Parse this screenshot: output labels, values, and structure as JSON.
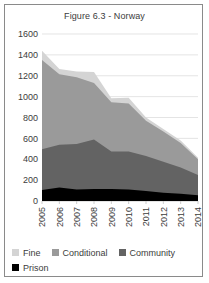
{
  "figure": {
    "title": "Figure 6.3 - Norway"
  },
  "legend": {
    "rows": [
      [
        {
          "label": "Fine",
          "color": "#d4d4d4",
          "icon": "square-swatch-icon"
        },
        {
          "label": "Conditional",
          "color": "#9a9a9a",
          "icon": "square-swatch-icon"
        },
        {
          "label": "Community",
          "color": "#636363",
          "icon": "square-swatch-icon"
        }
      ],
      [
        {
          "label": "Prison",
          "color": "#000000",
          "icon": "square-swatch-icon"
        }
      ]
    ]
  },
  "chart_data": {
    "type": "area",
    "title": "Figure 6.3 - Norway",
    "xlabel": "",
    "ylabel": "",
    "stacked": true,
    "grid": true,
    "legend_position": "bottom",
    "ylim": [
      0,
      1600
    ],
    "yticks": [
      0,
      200,
      400,
      600,
      800,
      1000,
      1200,
      1400,
      1600
    ],
    "ytick_labels": [
      "0",
      "200",
      "400",
      "600",
      "800",
      "1000",
      "1200",
      "1400",
      "1600"
    ],
    "categories": [
      "2005",
      "2006",
      "2007",
      "2008",
      "2009",
      "2010",
      "2011",
      "2012",
      "2013",
      "2014"
    ],
    "series": [
      {
        "name": "Prison",
        "color": "#000000",
        "values": [
          105,
          130,
          110,
          115,
          115,
          110,
          95,
          80,
          70,
          55
        ]
      },
      {
        "name": "Community",
        "color": "#636363",
        "values": [
          390,
          410,
          435,
          475,
          360,
          365,
          335,
          295,
          250,
          195
        ]
      },
      {
        "name": "Conditional",
        "color": "#9a9a9a",
        "values": [
          855,
          675,
          640,
          540,
          470,
          460,
          340,
          290,
          235,
          150
        ]
      },
      {
        "name": "Fine",
        "color": "#d4d4d4",
        "values": [
          90,
          50,
          55,
          105,
          40,
          55,
          30,
          25,
          25,
          15
        ]
      }
    ],
    "totals": [
      1440,
      1265,
      1240,
      1235,
      985,
      990,
      800,
      690,
      580,
      415
    ]
  }
}
